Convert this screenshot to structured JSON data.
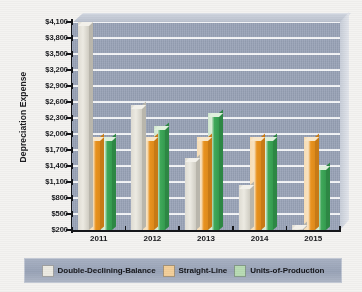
{
  "chart_data": {
    "type": "bar",
    "title": "",
    "xlabel": "",
    "ylabel": "Depreciation Expense",
    "categories": [
      "2011",
      "2012",
      "2013",
      "2014",
      "2015"
    ],
    "series": [
      {
        "name": "Double-Declining-Balance",
        "color": "#eceae2",
        "values": [
          4150,
          2550,
          1550,
          1050,
          300
        ]
      },
      {
        "name": "Straight-Line",
        "color": "#e8921f",
        "values": [
          1950,
          1950,
          1950,
          1950,
          1950
        ]
      },
      {
        "name": "Units-of-Production",
        "color": "#3fa85a",
        "values": [
          1950,
          2150,
          2400,
          1950,
          1400
        ]
      }
    ],
    "ylim": [
      200,
      4100
    ],
    "ytick_step": 300,
    "ytick_labels": [
      "$4,100",
      "$3,800",
      "$3,500",
      "$3,200",
      "$2,900",
      "$2,600",
      "$2,300",
      "$2,000",
      "$1,700",
      "$1,400",
      "$1,100",
      "$800",
      "$500",
      "$200"
    ],
    "ytick_values": [
      4100,
      3800,
      3500,
      3200,
      2900,
      2600,
      2300,
      2000,
      1700,
      1400,
      1100,
      800,
      500,
      200
    ],
    "grid": true,
    "legend_position": "bottom",
    "style": "3d-column",
    "plot_background_color": "#9aa4b8",
    "gridline_color": "#ffffff"
  },
  "legend": {
    "items": [
      {
        "label": "Double-Declining-Balance",
        "swatch": "#eceae2"
      },
      {
        "label": "Straight-Line",
        "swatch": "#f3cf9a"
      },
      {
        "label": "Units-of-Production",
        "swatch": "#b9dcb4"
      }
    ]
  }
}
